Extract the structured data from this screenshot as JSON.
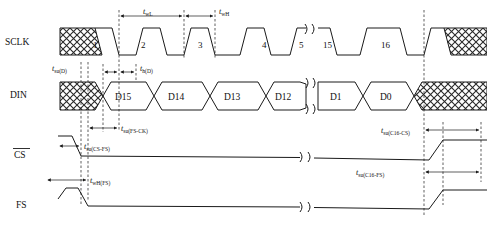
{
  "diagram": {
    "signals": [
      {
        "id": "sclk",
        "name": "SCLK",
        "overbar": false
      },
      {
        "id": "din",
        "name": "DIN",
        "overbar": false
      },
      {
        "id": "cs",
        "name": "CS",
        "overbar": true
      },
      {
        "id": "fs",
        "name": "FS",
        "overbar": false
      }
    ],
    "clock_cycles": [
      "1",
      "2",
      "3",
      "4",
      "5",
      "15",
      "16"
    ],
    "data_bits": [
      "D15",
      "D14",
      "D13",
      "D12",
      "D1",
      "D0"
    ],
    "timing_params": [
      {
        "id": "twl",
        "base": "t",
        "sub": "wL"
      },
      {
        "id": "twh",
        "base": "t",
        "sub": "wH"
      },
      {
        "id": "tsud",
        "base": "t",
        "sub": "su(D)"
      },
      {
        "id": "thd",
        "base": "t",
        "sub": "h(D)"
      },
      {
        "id": "tsufsck",
        "base": "t",
        "sub": "su(FS-CK)"
      },
      {
        "id": "tsucsfs",
        "base": "t",
        "sub": "su(CS-FS)"
      },
      {
        "id": "twhfs",
        "base": "t",
        "sub": "wH(FS)"
      },
      {
        "id": "tsuc16cs",
        "base": "t",
        "sub": "su(C16-CS)"
      },
      {
        "id": "tsuc16fs",
        "base": "t",
        "sub": "su(C16-FS)"
      }
    ],
    "colors": {
      "line": "#1a1a1a",
      "background": "#ffffff",
      "hatch": "#2a2a2a"
    },
    "notes": {
      "break_symbol": "waveform-break",
      "hatch_meaning": "dont-care"
    }
  }
}
